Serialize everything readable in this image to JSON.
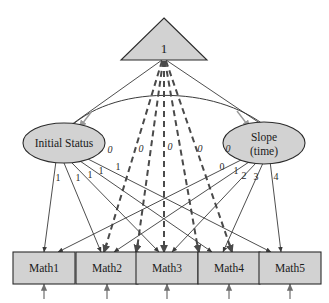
{
  "diagram": {
    "constant_node": {
      "label": "1",
      "shape": "triangle"
    },
    "latent_nodes": [
      {
        "id": "initial",
        "label": "Initial Status",
        "label_line2": "",
        "shape": "ellipse"
      },
      {
        "id": "slope",
        "label": "Slope",
        "label_line2": "(time)",
        "shape": "ellipse"
      }
    ],
    "observed_nodes": [
      {
        "id": "math1",
        "label": "Math1"
      },
      {
        "id": "math2",
        "label": "Math2"
      },
      {
        "id": "math3",
        "label": "Math3"
      },
      {
        "id": "math4",
        "label": "Math4"
      },
      {
        "id": "math5",
        "label": "Math5"
      }
    ],
    "intercept_labels": [
      "0",
      "0",
      "0",
      "0",
      "0"
    ],
    "initial_loadings": [
      "1",
      "1",
      "1",
      "1",
      "1"
    ],
    "slope_loadings": [
      "0",
      "1",
      "2",
      "3",
      "4"
    ],
    "colors": {
      "shape_fill": "#d2d2d2",
      "shape_stroke": "#2b2b2b",
      "solid_path": "#3a3a3a",
      "dashed_path": "#4a4a4a",
      "residual_path": "#9a9a9a",
      "background": "#ffffff"
    }
  }
}
